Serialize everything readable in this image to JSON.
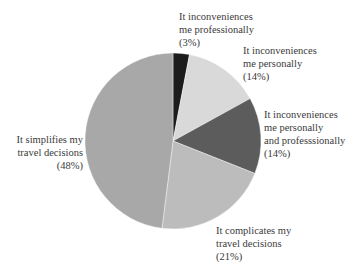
{
  "chart_data": {
    "type": "pie",
    "title": "",
    "start_angle_deg": 0,
    "direction": "clockwise",
    "slices": [
      {
        "label": "It inconveniences me professionally",
        "value": 3,
        "color": "#1c1c1c"
      },
      {
        "label": "It inconveniences me personally",
        "value": 14,
        "color": "#d9d9d9"
      },
      {
        "label": "It inconveniences me personally and professsionally",
        "value": 14,
        "color": "#5c5c5c"
      },
      {
        "label": "It complicates my travel decisions",
        "value": 21,
        "color": "#bcbcbc"
      },
      {
        "label": "It simplifies my travel decisions",
        "value": 48,
        "color": "#a8a8a8"
      }
    ],
    "legend": "none (direct labels)"
  },
  "labels": {
    "professionally": {
      "line1": "It inconveniences",
      "line2": "me professionally",
      "pct": "(3%)"
    },
    "personally": {
      "line1": "It inconveniences",
      "line2": "me personally",
      "pct": "(14%)"
    },
    "both": {
      "line1": "It inconveniences",
      "line2": "me personally",
      "line3": "and professsionally",
      "pct": "(14%)"
    },
    "complicates": {
      "line1": "It complicates my",
      "line2": "travel decisions",
      "pct": "(21%)"
    },
    "simplifies": {
      "line1": "It simplifies my",
      "line2": "travel decisions",
      "pct": "(48%)"
    }
  }
}
